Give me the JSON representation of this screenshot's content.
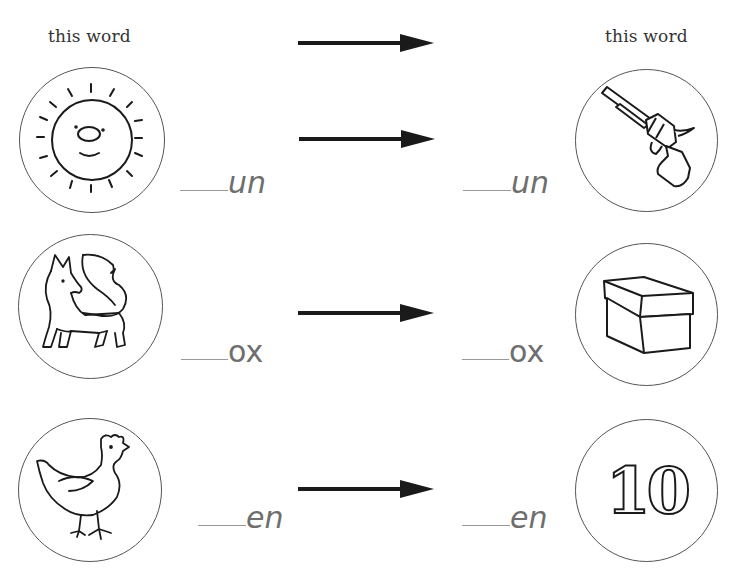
{
  "headers": {
    "left": "this word",
    "right": "this word"
  },
  "rows": [
    {
      "left_picture": "sun",
      "left_fragment": "un",
      "right_picture": "gun",
      "right_fragment": "un"
    },
    {
      "left_picture": "fox",
      "left_fragment": "ox",
      "right_picture": "box",
      "right_fragment": "ox"
    },
    {
      "left_picture": "hen",
      "left_fragment": "en",
      "right_picture": "ten",
      "right_fragment": "en"
    }
  ],
  "ten_numeral": "10",
  "colors": {
    "ink": "#1a1a1a",
    "fragment_text": "#6e6e6e",
    "blank_line": "#999999",
    "circle_border": "#555555"
  }
}
